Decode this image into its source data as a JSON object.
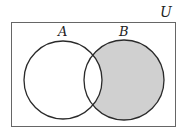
{
  "diagram": {
    "type": "venn",
    "universe_label": "U",
    "sets": [
      {
        "label": "A",
        "cx": 63,
        "cy": 80,
        "r": 39
      },
      {
        "label": "B",
        "cx": 124,
        "cy": 80,
        "r": 40
      }
    ],
    "shaded_region": "B \\ A",
    "colors": {
      "stroke": "#2a2a2a",
      "shade": "#d0d0d0",
      "frame": "#555555",
      "background": "#ffffff"
    }
  }
}
